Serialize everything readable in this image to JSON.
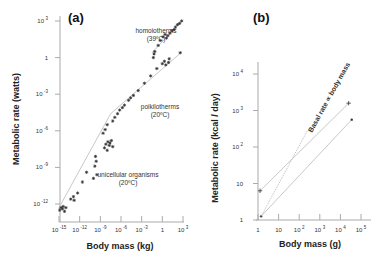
{
  "chart_data": [
    {
      "type": "scatter",
      "panel": "(a)",
      "title": "(a)",
      "xlabel": "Body mass (kg)",
      "ylabel": "Metabolic rate (watts)",
      "xscale": "log",
      "yscale": "log",
      "xlim_log10": [
        -15,
        3
      ],
      "ylim_log10": [
        -13,
        3.4
      ],
      "xticks": [
        {
          "base": "10",
          "exp": "-15",
          "log": -15
        },
        {
          "base": "10",
          "exp": "-12",
          "log": -12
        },
        {
          "base": "10",
          "exp": "-9",
          "log": -9
        },
        {
          "base": "10",
          "exp": "-6",
          "log": -6
        },
        {
          "base": "10",
          "exp": "-3",
          "log": -3
        },
        {
          "base": "1",
          "exp": "",
          "log": 0
        },
        {
          "base": "10",
          "exp": "3",
          "log": 3
        }
      ],
      "yticks": [
        {
          "base": "10",
          "exp": "3",
          "log": 3
        },
        {
          "base": "1",
          "exp": "",
          "log": 0
        },
        {
          "base": "10",
          "exp": "-3",
          "log": -3
        },
        {
          "base": "10",
          "exp": "-6",
          "log": -6
        },
        {
          "base": "10",
          "exp": "-9",
          "log": -9
        },
        {
          "base": "10",
          "exp": "-12",
          "log": -12
        }
      ],
      "grid": false,
      "annotations": [
        {
          "line1": "homoiotherms",
          "line2": "(39ºC)"
        },
        {
          "line1": "poikilotherms",
          "line2": "(20ºC)"
        },
        {
          "line1": "unicellular organisms",
          "line2": "(20ºC)"
        }
      ],
      "fit_lines": [
        {
          "name": "unicellular organisms",
          "x_log10": [
            -15,
            -7.5
          ],
          "y_log10": [
            -12.3,
            -4.6
          ]
        },
        {
          "name": "poikilotherms",
          "x_log10": [
            -7.5,
            2.7
          ],
          "y_log10": [
            -4.6,
            0.4
          ]
        },
        {
          "name": "homoiotherms",
          "x_log10": [
            -1.5,
            3.0
          ],
          "y_log10": [
            0.4,
            3.1
          ]
        }
      ],
      "series": [
        {
          "name": "unicellular organisms",
          "points_log10": [
            [
              -14.9,
              -12.5
            ],
            [
              -14.7,
              -12.3
            ],
            [
              -14.5,
              -12.4
            ],
            [
              -14.4,
              -12.2
            ],
            [
              -14.2,
              -12.6
            ],
            [
              -14.0,
              -12.3
            ],
            [
              -13.3,
              -11.6
            ],
            [
              -12.9,
              -11.4
            ],
            [
              -12.8,
              -11.7
            ],
            [
              -12.3,
              -11.1
            ],
            [
              -11.6,
              -10.2
            ],
            [
              -11.0,
              -9.4
            ],
            [
              -10.0,
              -9.9
            ],
            [
              -9.8,
              -8.9
            ],
            [
              -9.7,
              -8.1
            ],
            [
              -9.6,
              -8.5
            ],
            [
              -9.5,
              -9.6
            ],
            [
              -8.4,
              -7.4
            ],
            [
              -8.2,
              -7.1
            ],
            [
              -8.0,
              -7.6
            ],
            [
              -7.9,
              -6.9
            ],
            [
              -7.7,
              -7.2
            ],
            [
              -7.6,
              -7.0
            ],
            [
              -7.4,
              -6.8
            ],
            [
              -7.2,
              -7.3
            ]
          ]
        },
        {
          "name": "poikilotherms",
          "points_log10": [
            [
              -8.6,
              -6.2
            ],
            [
              -8.3,
              -5.9
            ],
            [
              -8.0,
              -5.5
            ],
            [
              -7.2,
              -5.2
            ],
            [
              -6.9,
              -4.9
            ],
            [
              -6.5,
              -4.6
            ],
            [
              -6.2,
              -4.3
            ],
            [
              -5.8,
              -4.1
            ],
            [
              -5.5,
              -3.9
            ],
            [
              -4.9,
              -3.5
            ],
            [
              -4.6,
              -3.3
            ],
            [
              -4.2,
              -3.1
            ],
            [
              -3.5,
              -2.7
            ],
            [
              -2.6,
              -2.1
            ],
            [
              -1.7,
              -1.5
            ],
            [
              -0.8,
              -0.9
            ],
            [
              0.0,
              -0.5
            ],
            [
              0.3,
              -0.3
            ],
            [
              0.5,
              -0.6
            ],
            [
              0.9,
              -0.4
            ],
            [
              1.0,
              -0.1
            ],
            [
              2.6,
              0.4
            ]
          ]
        },
        {
          "name": "homoiotherms",
          "points_log10": [
            [
              -1.3,
              0.0
            ],
            [
              -1.2,
              0.3
            ],
            [
              -1.1,
              0.5
            ],
            [
              -0.6,
              1.0
            ],
            [
              -0.3,
              1.4
            ],
            [
              0.1,
              1.7
            ],
            [
              0.4,
              1.9
            ],
            [
              0.6,
              1.6
            ],
            [
              0.8,
              1.8
            ],
            [
              1.1,
              2.0
            ],
            [
              1.4,
              2.2
            ],
            [
              1.7,
              2.3
            ],
            [
              1.9,
              2.5
            ],
            [
              2.2,
              2.7
            ],
            [
              2.5,
              2.8
            ],
            [
              2.8,
              3.0
            ]
          ]
        }
      ]
    },
    {
      "type": "line",
      "panel": "(b)",
      "title": "(b)",
      "xlabel": "Body mass (g)",
      "ylabel": "Metabolic rate (kcal / day)",
      "xscale": "log",
      "yscale": "log",
      "xlim_log10": [
        0,
        5.4
      ],
      "ylim_log10": [
        0,
        4.3
      ],
      "xticks": [
        {
          "base": "1",
          "exp": "",
          "log": 0
        },
        {
          "base": "10",
          "exp": "",
          "log": 1
        },
        {
          "base": "10",
          "exp": "2",
          "log": 2
        },
        {
          "base": "10",
          "exp": "3",
          "log": 3
        },
        {
          "base": "10",
          "exp": "4",
          "log": 4
        },
        {
          "base": "10",
          "exp": "5",
          "log": 5
        }
      ],
      "yticks": [
        {
          "base": "10",
          "exp": "4",
          "log": 4
        },
        {
          "base": "10",
          "exp": "3",
          "log": 3
        },
        {
          "base": "10",
          "exp": "2",
          "log": 2
        },
        {
          "base": "10",
          "exp": "",
          "log": 1
        },
        {
          "base": "1",
          "exp": "",
          "log": 0
        }
      ],
      "grid": false,
      "annotation": "Basal rate ∝ body mass",
      "series": [
        {
          "name": "upper (+ markers)",
          "marker": "+",
          "x_log10": [
            0.1,
            4.4
          ],
          "y_log10": [
            0.8,
            3.2
          ]
        },
        {
          "name": "lower (dot markers)",
          "marker": "dot",
          "x_log10": [
            0.15,
            4.55
          ],
          "y_log10": [
            0.1,
            2.75
          ]
        },
        {
          "name": "Basal rate ∝ body mass",
          "style": "dotted",
          "x_log10": [
            0.15,
            2.4
          ],
          "y_log10": [
            0.1,
            2.45
          ]
        }
      ]
    }
  ]
}
